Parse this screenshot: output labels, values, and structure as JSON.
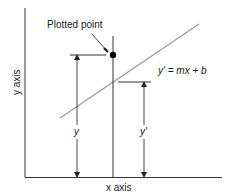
{
  "diagram": {
    "type": "residual-illustration",
    "labels": {
      "plotted_point": "Plotted point",
      "equation": "y' = mx + b",
      "y_measure": "y",
      "y_prime_measure": "y'",
      "x_axis": "x axis",
      "y_axis": "y axis"
    },
    "colors": {
      "axes": "#333333",
      "regression_line": "#9a9a9a",
      "point": "#000000",
      "text": "#1a1a1a"
    },
    "elements": {
      "point": {
        "x": 113,
        "y": 55,
        "r": 3
      },
      "regression_line": {
        "x1": 60,
        "y1": 118,
        "x2": 199,
        "y2": 24
      },
      "y_measure": {
        "arrow_x": 77,
        "top": 55,
        "bottom": 177
      },
      "y_prime_measure": {
        "arrow_x": 144,
        "top": 82,
        "bottom": 177
      }
    }
  }
}
